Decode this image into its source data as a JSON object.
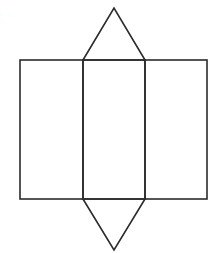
{
  "figure": {
    "label": "(b)",
    "visible_label_fragment": ")",
    "stroke_color": "#2b2b2b",
    "background": "#ffffff",
    "stroke_width": 1.6,
    "shapes": {
      "rect_left": {
        "x": 20,
        "y": 60,
        "w": 63,
        "h": 139
      },
      "rect_middle": {
        "x": 83,
        "y": 60,
        "w": 62,
        "h": 139
      },
      "rect_right": {
        "x": 145,
        "y": 60,
        "w": 62,
        "h": 139
      },
      "triangle_top": "83,60 114,8 145,60",
      "triangle_bottom": "83,199 114,250 145,199"
    }
  }
}
